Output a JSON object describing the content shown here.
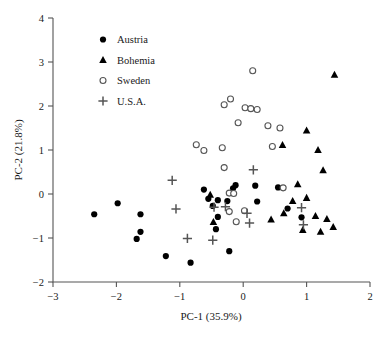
{
  "chart_data": {
    "type": "scatter",
    "title": "",
    "xlabel": "PC-1 (35.9%)",
    "ylabel": "PC-2 (21.8%)",
    "xlim": [
      -3,
      2
    ],
    "ylim": [
      -2,
      4
    ],
    "xticks": [
      -3,
      -2,
      -1,
      0,
      1,
      2
    ],
    "xtick_labels": [
      "−3",
      "−2",
      "−1",
      "0",
      "1",
      "2"
    ],
    "yticks": [
      -2,
      -1,
      0,
      1,
      2,
      3,
      4
    ],
    "ytick_labels": [
      "−2",
      "−1",
      "0",
      "1",
      "2",
      "3",
      "4"
    ],
    "grid": false,
    "legend_position": "upper-left-inside",
    "series": [
      {
        "name": "Austria",
        "marker": "filled-circle",
        "color": "#000000",
        "points": [
          [
            -2.35,
            -0.46
          ],
          [
            -1.98,
            -0.21
          ],
          [
            -1.62,
            -0.46
          ],
          [
            -1.62,
            -0.86
          ],
          [
            -1.68,
            -1.02
          ],
          [
            -1.22,
            -1.41
          ],
          [
            -0.83,
            -1.56
          ],
          [
            -0.22,
            -1.3
          ],
          [
            -0.62,
            0.1
          ],
          [
            -0.55,
            -0.11
          ],
          [
            -0.48,
            -0.27
          ],
          [
            -0.4,
            -0.14
          ],
          [
            -0.4,
            -0.52
          ],
          [
            -0.43,
            -0.8
          ],
          [
            -0.25,
            -0.16
          ],
          [
            -0.16,
            0.13
          ],
          [
            -0.12,
            0.2
          ],
          [
            0.19,
            0.19
          ],
          [
            0.22,
            -0.17
          ],
          [
            0.55,
            0.15
          ],
          [
            0.7,
            -0.33
          ],
          [
            0.92,
            -0.53
          ]
        ]
      },
      {
        "name": "Bohemia",
        "marker": "filled-triangle",
        "color": "#000000",
        "points": [
          [
            -0.52,
            -0.02
          ],
          [
            -0.47,
            -0.64
          ],
          [
            0.62,
            1.11
          ],
          [
            1.0,
            1.44
          ],
          [
            1.44,
            2.71
          ],
          [
            1.18,
            1.0
          ],
          [
            1.26,
            0.54
          ],
          [
            0.86,
            0.22
          ],
          [
            0.78,
            -0.16
          ],
          [
            1.0,
            -0.09
          ],
          [
            1.14,
            -0.5
          ],
          [
            1.32,
            -0.57
          ],
          [
            1.42,
            -0.75
          ],
          [
            0.64,
            -0.44
          ],
          [
            0.44,
            -0.58
          ],
          [
            0.94,
            -0.82
          ],
          [
            1.22,
            -0.86
          ]
        ]
      },
      {
        "name": "Sweden",
        "marker": "open-circle",
        "color": "#555555",
        "points": [
          [
            0.15,
            2.8
          ],
          [
            -0.3,
            2.03
          ],
          [
            -0.2,
            2.16
          ],
          [
            0.03,
            1.96
          ],
          [
            0.12,
            1.94
          ],
          [
            0.22,
            1.92
          ],
          [
            -0.08,
            1.62
          ],
          [
            0.39,
            1.55
          ],
          [
            0.58,
            1.5
          ],
          [
            -0.74,
            1.12
          ],
          [
            -0.62,
            0.99
          ],
          [
            -0.33,
            1.05
          ],
          [
            0.46,
            1.08
          ],
          [
            -0.3,
            0.6
          ],
          [
            -0.22,
            0.02
          ],
          [
            -0.15,
            0.01
          ],
          [
            -0.22,
            -0.4
          ],
          [
            -0.11,
            -0.63
          ],
          [
            0.02,
            -0.38
          ],
          [
            0.63,
            0.14
          ]
        ]
      },
      {
        "name": "U.S.A.",
        "marker": "plus",
        "color": "#555555",
        "points": [
          [
            -1.12,
            0.31
          ],
          [
            -1.06,
            -0.34
          ],
          [
            -0.88,
            -1.01
          ],
          [
            -0.48,
            -1.05
          ],
          [
            -0.46,
            -0.3
          ],
          [
            -0.28,
            -0.29
          ],
          [
            0.06,
            -0.44
          ],
          [
            0.1,
            -0.66
          ],
          [
            0.92,
            -0.31
          ],
          [
            0.95,
            -0.7
          ],
          [
            0.16,
            0.55
          ]
        ]
      }
    ]
  },
  "legend": {
    "items": [
      {
        "label": "Austria"
      },
      {
        "label": "Bohemia"
      },
      {
        "label": "Sweden"
      },
      {
        "label": "U.S.A."
      }
    ]
  }
}
